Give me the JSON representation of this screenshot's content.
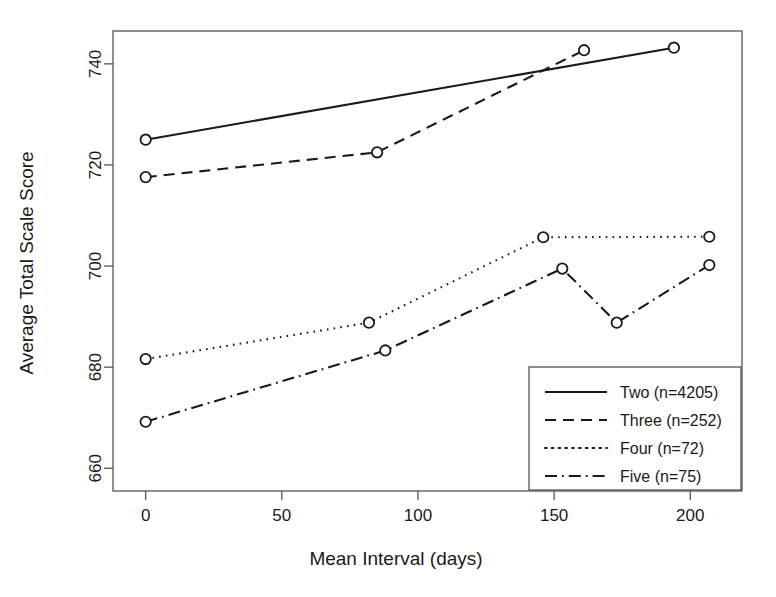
{
  "chart_data": {
    "type": "line",
    "title": "",
    "xlabel": "Mean Interval (days)",
    "ylabel": "Average Total Scale Score",
    "xlim": [
      -12,
      219
    ],
    "ylim": [
      655.5,
      746.5
    ],
    "xticks": [
      0,
      50,
      100,
      150,
      200
    ],
    "yticks": [
      660,
      680,
      700,
      720,
      740
    ],
    "xtick_labels": [
      "0",
      "50",
      "100",
      "150",
      "200"
    ],
    "ytick_labels": [
      "660",
      "680",
      "700",
      "720",
      "740"
    ],
    "grid": false,
    "legend_position": "bottom-right",
    "series": [
      {
        "name": "Two (n=4205)",
        "label": "Two (n=4205)",
        "linestyle": "solid",
        "marker": "circle",
        "x": [
          0,
          194
        ],
        "y": [
          725.0,
          743.2
        ]
      },
      {
        "name": "Three (n=252)",
        "label": "Three (n=252)",
        "linestyle": "dashed",
        "marker": "circle",
        "x": [
          0,
          85,
          161
        ],
        "y": [
          717.6,
          722.5,
          742.7
        ]
      },
      {
        "name": "Four (n=72)",
        "label": "Four (n=72)",
        "linestyle": "dotted",
        "marker": "circle",
        "x": [
          0,
          82,
          146,
          207
        ],
        "y": [
          681.6,
          688.8,
          705.7,
          705.8
        ]
      },
      {
        "name": "Five (n=75)",
        "label": "Five (n=75)",
        "linestyle": "dashdot",
        "marker": "circle",
        "x": [
          0,
          88,
          153,
          173,
          207
        ],
        "y": [
          669.2,
          683.3,
          699.5,
          688.8,
          700.2
        ]
      }
    ]
  },
  "legend": {
    "entries": [
      {
        "label": "Two (n=4205)",
        "style": "solid"
      },
      {
        "label": "Three (n=252)",
        "style": "dashed"
      },
      {
        "label": "Four (n=72)",
        "style": "dotted"
      },
      {
        "label": "Five (n=75)",
        "style": "dashdot"
      }
    ]
  },
  "colors": {
    "ink": "#1a1a1a",
    "frame": "#555555",
    "background": "#ffffff"
  }
}
